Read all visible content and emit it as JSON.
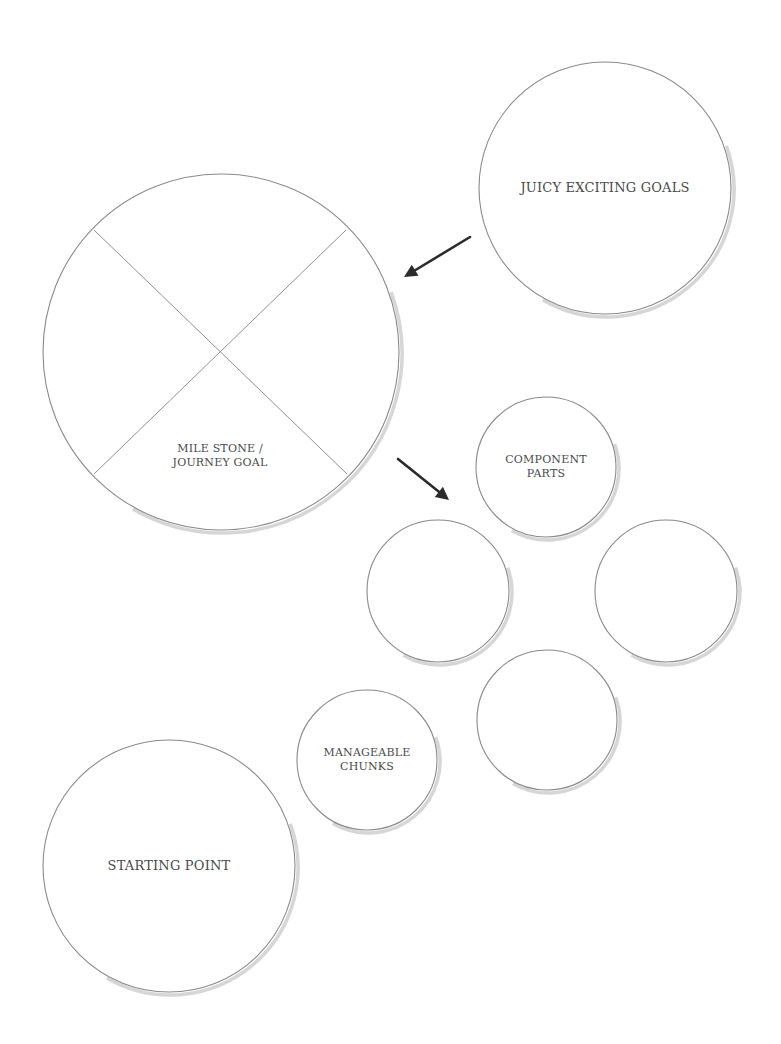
{
  "diagram": {
    "title": "",
    "colors": {
      "background": "#ffffff",
      "circle_stroke": "#8a8a8a",
      "circle_shadow": "#cfcfcf",
      "divider": "#8f8f8f",
      "arrow": "#2b2b2b",
      "text": "#4a4a4a"
    },
    "nodes": [
      {
        "id": "juicy-exciting-goals",
        "lines": [
          "JUICY EXCITING GOALS"
        ],
        "cx": 605,
        "cy": 188,
        "r": 126,
        "font_size": 13
      },
      {
        "id": "milestone-journey-goal",
        "lines": [
          "MILE STONE /",
          "JOURNEY GOAL"
        ],
        "cx": 221,
        "cy": 352,
        "r": 178,
        "font_size": 11,
        "label_x": 220,
        "label_y": 456,
        "quartered": true
      },
      {
        "id": "component-parts",
        "lines": [
          "COMPONENT",
          "PARTS"
        ],
        "cx": 546,
        "cy": 467,
        "r": 70,
        "font_size": 11
      },
      {
        "id": "component-left",
        "lines": [],
        "cx": 438,
        "cy": 591,
        "r": 71
      },
      {
        "id": "component-right",
        "lines": [],
        "cx": 666,
        "cy": 591,
        "r": 71
      },
      {
        "id": "component-bottom",
        "lines": [],
        "cx": 547,
        "cy": 720,
        "r": 70
      },
      {
        "id": "manageable-chunks",
        "lines": [
          "MANAGEABLE",
          "CHUNKS"
        ],
        "cx": 367,
        "cy": 760,
        "r": 70,
        "font_size": 11
      },
      {
        "id": "starting-point",
        "lines": [
          "STARTING POINT"
        ],
        "cx": 169,
        "cy": 866,
        "r": 126,
        "font_size": 13
      }
    ],
    "dividers": [
      {
        "x1": 94,
        "y1": 230,
        "x2": 347,
        "y2": 474
      },
      {
        "x1": 346,
        "y1": 230,
        "x2": 94,
        "y2": 474
      }
    ],
    "arrows": [
      {
        "id": "goals-to-milestone",
        "x1": 470,
        "y1": 237,
        "x2": 404,
        "y2": 277
      },
      {
        "id": "milestone-to-components",
        "x1": 398,
        "y1": 459,
        "x2": 449,
        "y2": 500
      }
    ]
  }
}
